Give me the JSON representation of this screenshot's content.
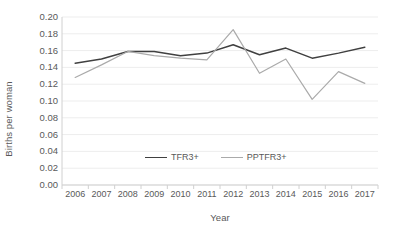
{
  "chart_data": {
    "type": "line",
    "title": "",
    "xlabel": "Year",
    "ylabel": "Births per woman",
    "categories": [
      2006,
      2007,
      2008,
      2009,
      2010,
      2011,
      2012,
      2013,
      2014,
      2015,
      2016,
      2017
    ],
    "x_tick_labels": [
      "2006",
      "2007",
      "2008",
      "2009",
      "2010",
      "2011",
      "2012",
      "2013",
      "2014",
      "2015",
      "2016",
      "2017"
    ],
    "y_tick_labels": [
      "0.20",
      "0.18",
      "0.16",
      "0.14",
      "0.12",
      "0.10",
      "0.08",
      "0.06",
      "0.04",
      "0.02",
      "0.00"
    ],
    "y_tick_values": [
      0.2,
      0.18,
      0.16,
      0.14,
      0.12,
      0.1,
      0.08,
      0.06,
      0.04,
      0.02,
      0.0
    ],
    "ylim": [
      0.0,
      0.2
    ],
    "grid": "horizontal",
    "legend_position": "inside-bottom-center",
    "series": [
      {
        "name": "TFR3+",
        "color": "#404040",
        "values": [
          0.145,
          0.15,
          0.159,
          0.159,
          0.154,
          0.157,
          0.167,
          0.155,
          0.163,
          0.151,
          0.157,
          0.164
        ]
      },
      {
        "name": "PPTFR3+",
        "color": "#aaaaaa",
        "values": [
          0.128,
          0.143,
          0.159,
          0.154,
          0.151,
          0.149,
          0.185,
          0.133,
          0.15,
          0.102,
          0.135,
          0.121
        ]
      }
    ]
  },
  "axes": {
    "y_title": "Births per woman",
    "x_title": "Year"
  },
  "legend": {
    "items": [
      {
        "label": "TFR3+",
        "color": "#404040"
      },
      {
        "label": "PPTFR3+",
        "color": "#aaaaaa"
      }
    ]
  },
  "colors": {
    "axis_line": "#d0d0d0",
    "gridline": "#ededed",
    "tick_text": "#595959",
    "series_1": "#404040",
    "series_2": "#aaaaaa",
    "background": "#ffffff"
  }
}
